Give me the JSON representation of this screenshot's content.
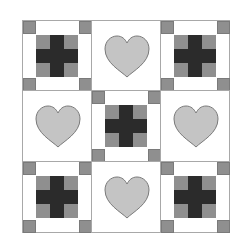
{
  "grid": {
    "rows": 3,
    "cols": 3
  },
  "colors": {
    "background": "#ffffff",
    "block_border": "#a8a8a8",
    "corner_gray": "#8f8f8f",
    "cross_dark": "#2b2b2b",
    "heart_fill": "#c4c4c4",
    "heart_stroke": "#7a7a7a"
  },
  "blocks": [
    {
      "row": 0,
      "col": 0,
      "type": "cross"
    },
    {
      "row": 0,
      "col": 1,
      "type": "heart"
    },
    {
      "row": 0,
      "col": 2,
      "type": "cross"
    },
    {
      "row": 1,
      "col": 0,
      "type": "heart"
    },
    {
      "row": 1,
      "col": 1,
      "type": "cross"
    },
    {
      "row": 1,
      "col": 2,
      "type": "heart"
    },
    {
      "row": 2,
      "col": 0,
      "type": "cross"
    },
    {
      "row": 2,
      "col": 1,
      "type": "heart"
    },
    {
      "row": 2,
      "col": 2,
      "type": "cross"
    }
  ]
}
